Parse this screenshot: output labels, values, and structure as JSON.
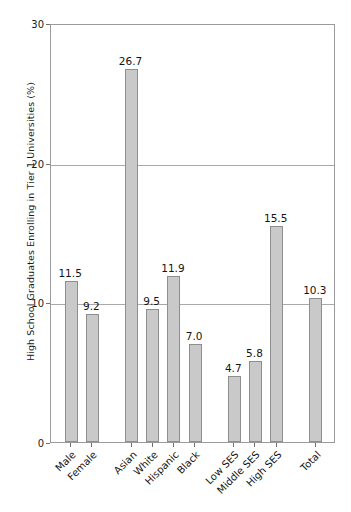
{
  "chart_data": {
    "type": "bar",
    "title": "",
    "xlabel": "",
    "ylabel": "High School Graduates Enrolling in Tier 1 Universities (%)",
    "categories": [
      "Male",
      "Female",
      "Asian",
      "White",
      "Hispanic",
      "Black",
      "Low SES",
      "Middle SES",
      "High SES",
      "Total"
    ],
    "values": [
      11.5,
      9.2,
      26.7,
      9.5,
      11.9,
      7.0,
      4.7,
      5.8,
      15.5,
      10.3
    ],
    "value_labels": [
      "11.5",
      "9.2",
      "26.7",
      "9.5",
      "11.9",
      "7.0",
      "4.7",
      "5.8",
      "15.5",
      "10.3"
    ],
    "ylim": [
      0,
      30
    ],
    "yticks": [
      0,
      10,
      20,
      30
    ],
    "ytick_labels": [
      "0",
      "10",
      "20",
      "30"
    ],
    "grid": "horizontal",
    "legend": "none",
    "bar_color": "#c9c9c9",
    "bar_edge_color": "#8e8e8e",
    "axis_color": "#9a9a9a",
    "grid_color": "#a9a9a9",
    "text_color": "#141414",
    "groups": [
      {
        "name": "Gender",
        "indices": [
          0,
          1
        ]
      },
      {
        "name": "Race/Ethnicity",
        "indices": [
          2,
          3,
          4,
          5
        ]
      },
      {
        "name": "Socioeconomic Status",
        "indices": [
          6,
          7,
          8
        ]
      },
      {
        "name": "Overall",
        "indices": [
          9
        ]
      }
    ]
  }
}
